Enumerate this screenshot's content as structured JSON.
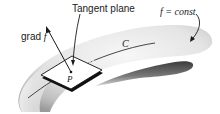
{
  "diagram": {
    "labels": {
      "tangent_plane": "Tangent plane",
      "grad_prefix": "grad ",
      "grad_f": "f",
      "surface_prefix": "f",
      "surface_eq": " = const",
      "curve": "C",
      "point": "P"
    },
    "colors": {
      "ink": "#1a1a1a",
      "surface_light": "#f2f2f2",
      "surface_mid": "#cfcfcf",
      "surface_dark": "#5a5a5a",
      "plane_fill": "#ffffff"
    },
    "elements": [
      {
        "id": "level-surface",
        "kind": "shaded surface",
        "label": "f = const"
      },
      {
        "id": "curve-C",
        "kind": "curve on surface",
        "label": "C"
      },
      {
        "id": "point-P",
        "kind": "point",
        "label": "P"
      },
      {
        "id": "tangent-plane",
        "kind": "parallelogram",
        "label": "Tangent plane"
      },
      {
        "id": "grad-vector",
        "kind": "arrow",
        "label": "grad f"
      }
    ]
  }
}
